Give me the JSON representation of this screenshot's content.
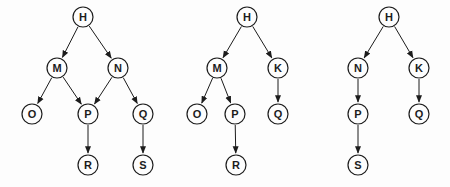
{
  "figure": {
    "width": 450,
    "height": 187,
    "background": "#fdfdfd",
    "node_radius": 10,
    "node_fill": "#fdfdfd",
    "stroke_color": "#1c1c1c",
    "label_color": "#1c1c1c",
    "edge_stroke_width": 1,
    "node_stroke_width": 1.2,
    "label_font_size": 11
  },
  "diagrams": [
    {
      "name": "tree-1",
      "nodes": [
        {
          "id": "H",
          "x": 83,
          "y": 17
        },
        {
          "id": "M",
          "x": 57,
          "y": 68
        },
        {
          "id": "N",
          "x": 118,
          "y": 68
        },
        {
          "id": "O",
          "x": 32,
          "y": 114
        },
        {
          "id": "P",
          "x": 88,
          "y": 114
        },
        {
          "id": "Q",
          "x": 143,
          "y": 114
        },
        {
          "id": "R",
          "x": 88,
          "y": 165
        },
        {
          "id": "S",
          "x": 143,
          "y": 165
        }
      ],
      "edges": [
        [
          "H",
          "M"
        ],
        [
          "H",
          "N"
        ],
        [
          "M",
          "O"
        ],
        [
          "M",
          "P"
        ],
        [
          "N",
          "P"
        ],
        [
          "N",
          "Q"
        ],
        [
          "P",
          "R"
        ],
        [
          "Q",
          "S"
        ]
      ]
    },
    {
      "name": "tree-2",
      "nodes": [
        {
          "id": "H",
          "x": 247,
          "y": 17
        },
        {
          "id": "M",
          "x": 217,
          "y": 68
        },
        {
          "id": "K",
          "x": 278,
          "y": 68
        },
        {
          "id": "O",
          "x": 197,
          "y": 114
        },
        {
          "id": "P",
          "x": 235,
          "y": 114
        },
        {
          "id": "Q",
          "x": 278,
          "y": 114
        },
        {
          "id": "R",
          "x": 236,
          "y": 165
        }
      ],
      "edges": [
        [
          "H",
          "M"
        ],
        [
          "H",
          "K"
        ],
        [
          "M",
          "O"
        ],
        [
          "M",
          "P"
        ],
        [
          "K",
          "Q"
        ],
        [
          "P",
          "R"
        ]
      ]
    },
    {
      "name": "tree-3",
      "nodes": [
        {
          "id": "H",
          "x": 389,
          "y": 17
        },
        {
          "id": "N",
          "x": 358,
          "y": 68
        },
        {
          "id": "K",
          "x": 419,
          "y": 68
        },
        {
          "id": "P",
          "x": 358,
          "y": 114
        },
        {
          "id": "Q",
          "x": 419,
          "y": 114
        },
        {
          "id": "S",
          "x": 358,
          "y": 165
        }
      ],
      "edges": [
        [
          "H",
          "N"
        ],
        [
          "H",
          "K"
        ],
        [
          "N",
          "P"
        ],
        [
          "K",
          "Q"
        ],
        [
          "P",
          "S"
        ]
      ]
    }
  ]
}
